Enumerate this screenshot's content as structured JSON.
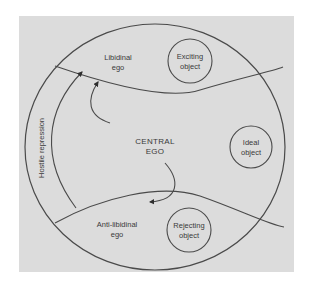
{
  "diagram": {
    "type": "psychoanalytic-structure",
    "colors": {
      "background": "#ffffff",
      "panel": "#dcdcdc",
      "stroke": "#4a4a4a",
      "text": "#3a3a3a"
    },
    "regions": {
      "libidinal_ego": {
        "line1": "Libidinal",
        "line2": "ego"
      },
      "central_ego": {
        "line1": "CENTRAL",
        "line2": "EGO"
      },
      "anti_libidinal_ego": {
        "line1": "Anti-libidinal",
        "line2": "ego"
      }
    },
    "objects": {
      "exciting": {
        "line1": "Exciting",
        "line2": "object"
      },
      "ideal": {
        "line1": "Ideal",
        "line2": "object"
      },
      "rejecting": {
        "line1": "Rejecting",
        "line2": "object"
      }
    },
    "arrows": {
      "hostile_repression": {
        "label": "Hostile repression"
      }
    }
  }
}
